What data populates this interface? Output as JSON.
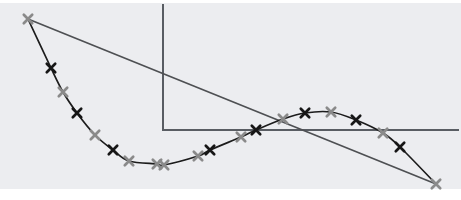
{
  "figure": {
    "width": 461,
    "height": 200,
    "page_background": "#ffffff",
    "plot_background": "#ecedf0",
    "plot_band_top": 3,
    "plot_band_bottom": 189
  },
  "chart_data": {
    "type": "line",
    "title": "",
    "xlabel": "",
    "ylabel": "",
    "axes": {
      "color": "#595d63",
      "stroke_width": 2,
      "origin": {
        "x": 163,
        "y": 130
      },
      "y_axis_top": 4,
      "x_axis_right": 459,
      "grid": false
    },
    "secant_line": {
      "color": "#4e5053",
      "stroke_width": 1.7,
      "from": {
        "x": 28,
        "y": 19
      },
      "to": {
        "x": 436,
        "y": 184
      }
    },
    "curve": {
      "color": "#1c1c1c",
      "stroke_width": 1.7,
      "points": [
        [
          28,
          19
        ],
        [
          51,
          68
        ],
        [
          63,
          92
        ],
        [
          77,
          113
        ],
        [
          95,
          135
        ],
        [
          113,
          150
        ],
        [
          129,
          161
        ],
        [
          157,
          164
        ],
        [
          164,
          165
        ],
        [
          198,
          156
        ],
        [
          210,
          150
        ],
        [
          241,
          137
        ],
        [
          256,
          130
        ],
        [
          283,
          119
        ],
        [
          305,
          113
        ],
        [
          331,
          112
        ],
        [
          356,
          120
        ],
        [
          383,
          133
        ],
        [
          400,
          147
        ],
        [
          436,
          184
        ]
      ]
    },
    "markers": {
      "shape": "x-cross",
      "half_size": 4.2,
      "stroke_width": 2.7,
      "colors": {
        "gray": "#8a8a8a",
        "black": "#161616"
      },
      "points": [
        {
          "x": 28,
          "y": 19,
          "c": "gray"
        },
        {
          "x": 51,
          "y": 68,
          "c": "black"
        },
        {
          "x": 63,
          "y": 92,
          "c": "gray"
        },
        {
          "x": 77,
          "y": 113,
          "c": "black"
        },
        {
          "x": 95,
          "y": 135,
          "c": "gray"
        },
        {
          "x": 113,
          "y": 150,
          "c": "black"
        },
        {
          "x": 129,
          "y": 161,
          "c": "gray"
        },
        {
          "x": 157,
          "y": 164,
          "c": "gray"
        },
        {
          "x": 164,
          "y": 165,
          "c": "gray"
        },
        {
          "x": 198,
          "y": 156,
          "c": "gray"
        },
        {
          "x": 210,
          "y": 150,
          "c": "black"
        },
        {
          "x": 241,
          "y": 137,
          "c": "gray"
        },
        {
          "x": 256,
          "y": 130,
          "c": "black"
        },
        {
          "x": 283,
          "y": 119,
          "c": "gray"
        },
        {
          "x": 305,
          "y": 113,
          "c": "black"
        },
        {
          "x": 331,
          "y": 112,
          "c": "gray"
        },
        {
          "x": 356,
          "y": 120,
          "c": "black"
        },
        {
          "x": 383,
          "y": 133,
          "c": "gray"
        },
        {
          "x": 400,
          "y": 147,
          "c": "black"
        },
        {
          "x": 436,
          "y": 184,
          "c": "gray"
        }
      ]
    }
  }
}
